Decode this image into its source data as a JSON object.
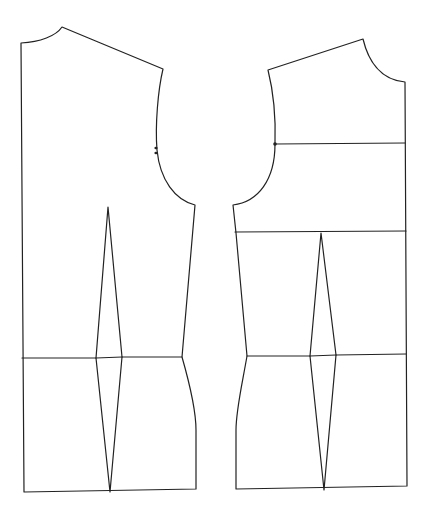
{
  "diagram": {
    "type": "sewing-pattern-bodice",
    "colors": {
      "background": "#ffffff",
      "stroke": "#222222"
    },
    "stroke_width": 1.2,
    "pieces": [
      {
        "id": "back",
        "label": "",
        "outline": "M 21 43 C 40 42, 56 36, 62 27 L 163 69 C 158 90, 155 125, 157 150 C 160 180, 175 200, 195 205 L 182 357 C 190 385, 196 410, 196 430 L 196 489 L 24 492 Z",
        "lines": [
          {
            "name": "waist-line",
            "d": "M 22 358 L 96 358 L 122 357 L 182 357"
          },
          {
            "name": "dart-upper",
            "d": "M 96 358 L 108 207 L 122 357"
          },
          {
            "name": "dart-lower",
            "d": "M 96 358 L 110 492 L 122 357"
          }
        ],
        "notches": [
          {
            "x": 156,
            "y": 148
          },
          {
            "x": 156,
            "y": 153
          }
        ],
        "dots": []
      },
      {
        "id": "front",
        "label": "",
        "outline": "M 268 70 L 363 39 C 368 60, 380 80, 405 82 L 407 486 L 236 489 L 236 430 C 236 410, 242 385, 247 356 L 236 233 L 233 205 C 258 202, 275 180, 275 144 C 276 115, 273 90, 268 70 Z",
        "lines": [
          {
            "name": "bust-line",
            "d": "M 275 144 L 405 143"
          },
          {
            "name": "underarm-line",
            "d": "M 235 232 L 406 231"
          },
          {
            "name": "waist-line",
            "d": "M 247 356 L 310 356 L 336 355 L 406 354"
          },
          {
            "name": "dart-upper",
            "d": "M 310 356 L 321 233 L 336 355"
          },
          {
            "name": "dart-lower",
            "d": "M 310 356 L 324 490 L 336 355"
          }
        ],
        "notches": [],
        "dots": [
          {
            "x": 275,
            "y": 144
          }
        ]
      }
    ]
  }
}
